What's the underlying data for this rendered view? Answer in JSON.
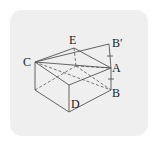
{
  "figure": {
    "labels": {
      "C": "C",
      "E": "E",
      "B_prime": "B′",
      "A": "A",
      "B": "B",
      "D": "D"
    },
    "colors": {
      "background": "#efefef",
      "line": "#555555",
      "text": "#222222"
    }
  }
}
